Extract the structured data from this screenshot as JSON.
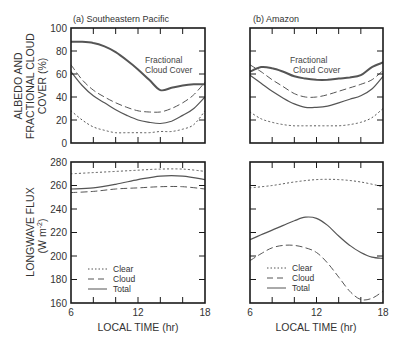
{
  "chart_data": [
    {
      "type": "line",
      "id": "a-top",
      "title": "(a) Southeastern Pacific",
      "xlabel": "",
      "ylabel": "ALBEDO AND FRACTIONAL CLOUD COVER (%)",
      "xlim": [
        6,
        18
      ],
      "ylim": [
        0,
        100
      ],
      "yticks": [
        0,
        20,
        40,
        60,
        80,
        100
      ],
      "xticks": [
        6,
        8,
        10,
        12,
        14,
        16,
        18
      ],
      "annotation": "Fractional Cloud Cover",
      "series": [
        {
          "name": "Fractional Cloud Cover",
          "style": "thick",
          "x": [
            6,
            7,
            8,
            9,
            10,
            11,
            12,
            13,
            14,
            15,
            16,
            17,
            18
          ],
          "values": [
            88,
            88,
            87,
            84,
            79,
            72,
            64,
            55,
            46,
            48,
            50,
            51,
            51
          ]
        },
        {
          "name": "Cloud",
          "style": "dashed",
          "x": [
            6,
            7,
            8,
            9,
            10,
            11,
            12,
            13,
            14,
            15,
            16,
            17,
            18
          ],
          "values": [
            68,
            55,
            46,
            40,
            35,
            31,
            28,
            27,
            27,
            30,
            35,
            42,
            53
          ]
        },
        {
          "name": "Total",
          "style": "solid",
          "x": [
            6,
            7,
            8,
            9,
            10,
            11,
            12,
            13,
            14,
            15,
            16,
            17,
            18
          ],
          "values": [
            62,
            50,
            41,
            35,
            29,
            24,
            20,
            18,
            17,
            19,
            24,
            30,
            40
          ]
        },
        {
          "name": "Clear",
          "style": "dotted",
          "x": [
            6,
            7,
            8,
            9,
            10,
            11,
            12,
            13,
            14,
            15,
            16,
            17,
            18
          ],
          "values": [
            28,
            20,
            14,
            11,
            9,
            9,
            9,
            9,
            10,
            10,
            12,
            16,
            28
          ]
        }
      ]
    },
    {
      "type": "line",
      "id": "b-top",
      "title": "(b) Amazon",
      "xlabel": "",
      "ylabel": "",
      "xlim": [
        6,
        18
      ],
      "ylim": [
        0,
        100
      ],
      "yticks": [
        0,
        20,
        40,
        60,
        80,
        100
      ],
      "xticks": [
        6,
        8,
        10,
        12,
        14,
        16,
        18
      ],
      "annotation": "Fractional Cloud Cover",
      "series": [
        {
          "name": "Fractional Cloud Cover",
          "style": "thick",
          "x": [
            6,
            7,
            8,
            9,
            10,
            11,
            12,
            13,
            14,
            15,
            16,
            17,
            18
          ],
          "values": [
            62,
            66,
            65,
            62,
            58,
            56,
            55,
            55,
            56,
            57,
            59,
            66,
            70
          ]
        },
        {
          "name": "Cloud",
          "style": "dashed",
          "x": [
            6,
            7,
            8,
            9,
            10,
            11,
            12,
            13,
            14,
            15,
            16,
            17,
            18
          ],
          "values": [
            68,
            62,
            55,
            49,
            43,
            40,
            40,
            42,
            45,
            48,
            51,
            55,
            63
          ]
        },
        {
          "name": "Total",
          "style": "solid",
          "x": [
            6,
            7,
            8,
            9,
            10,
            11,
            12,
            13,
            14,
            15,
            16,
            17,
            18
          ],
          "values": [
            59,
            52,
            45,
            39,
            34,
            31,
            31,
            32,
            35,
            38,
            41,
            47,
            58
          ]
        },
        {
          "name": "Clear",
          "style": "dotted",
          "x": [
            6,
            7,
            8,
            9,
            10,
            11,
            12,
            13,
            14,
            15,
            16,
            17,
            18
          ],
          "values": [
            27,
            21,
            18,
            16,
            15,
            15,
            15,
            15,
            15,
            16,
            18,
            22,
            30
          ]
        }
      ]
    },
    {
      "type": "line",
      "id": "a-bottom",
      "title": "",
      "xlabel": "LOCAL TIME (hr)",
      "ylabel": "LONGWAVE FLUX (W m-2)",
      "xlim": [
        6,
        18
      ],
      "ylim": [
        160,
        280
      ],
      "yticks": [
        160,
        180,
        200,
        220,
        240,
        260,
        280
      ],
      "xticks": [
        6,
        8,
        10,
        12,
        14,
        16,
        18
      ],
      "xticklabels": [
        "6",
        "",
        "",
        "12",
        "",
        "",
        "18"
      ],
      "legend": [
        "Clear",
        "Cloud",
        "Total"
      ],
      "series": [
        {
          "name": "Clear",
          "style": "dotted",
          "x": [
            6,
            8,
            10,
            12,
            14,
            16,
            18
          ],
          "values": [
            270,
            271,
            272,
            273,
            274,
            274,
            272
          ]
        },
        {
          "name": "Cloud",
          "style": "dashed",
          "x": [
            6,
            8,
            10,
            12,
            14,
            16,
            18
          ],
          "values": [
            254,
            255,
            257,
            258,
            259,
            259,
            257
          ]
        },
        {
          "name": "Total",
          "style": "solid",
          "x": [
            6,
            8,
            10,
            12,
            14,
            16,
            18
          ],
          "values": [
            257,
            258,
            261,
            265,
            268,
            268,
            265
          ]
        }
      ]
    },
    {
      "type": "line",
      "id": "b-bottom",
      "title": "",
      "xlabel": "LOCAL TIME (hr)",
      "ylabel": "",
      "xlim": [
        6,
        18
      ],
      "ylim": [
        160,
        280
      ],
      "yticks": [
        160,
        180,
        200,
        220,
        240,
        260,
        280
      ],
      "xticks": [
        6,
        8,
        10,
        12,
        14,
        16,
        18
      ],
      "xticklabels": [
        "6",
        "",
        "",
        "12",
        "",
        "",
        "18"
      ],
      "legend": [
        "Clear",
        "Cloud",
        "Total"
      ],
      "series": [
        {
          "name": "Clear",
          "style": "dotted",
          "x": [
            6,
            8,
            10,
            12,
            14,
            16,
            18
          ],
          "values": [
            258,
            260,
            263,
            265,
            265,
            263,
            259
          ]
        },
        {
          "name": "Cloud",
          "style": "dashed",
          "x": [
            6,
            7,
            8,
            9,
            10,
            11,
            12,
            13,
            14,
            15,
            16,
            17,
            18
          ],
          "values": [
            196,
            202,
            207,
            209,
            209,
            207,
            203,
            194,
            182,
            170,
            163,
            164,
            170
          ]
        },
        {
          "name": "Total",
          "style": "solid",
          "x": [
            6,
            7,
            8,
            9,
            10,
            11,
            12,
            13,
            14,
            15,
            16,
            17,
            18
          ],
          "values": [
            214,
            218,
            222,
            226,
            230,
            233,
            232,
            226,
            217,
            209,
            203,
            199,
            198
          ]
        }
      ]
    }
  ],
  "labels": {
    "panel_a_title": "(a) Southeastern Pacific",
    "panel_b_title": "(b) Amazon",
    "top_ylabel_line1": "ALBEDO AND",
    "top_ylabel_line2": "FRACTIONAL CLOUD",
    "top_ylabel_line3": "COVER (%)",
    "bottom_ylabel_line1": "LONGWAVE FLUX",
    "bottom_ylabel_line2": "(W m",
    "bottom_ylabel_sup": "-2",
    "bottom_ylabel_close": ")",
    "xlabel": "LOCAL TIME (hr)",
    "annotation_line1": "Fractional",
    "annotation_line2": "Cloud Cover",
    "legend_clear": "Clear",
    "legend_cloud": "Cloud",
    "legend_total": "Total"
  },
  "colors": {
    "line": "#555555",
    "frame": "#1a1a1a",
    "text": "#333333"
  }
}
